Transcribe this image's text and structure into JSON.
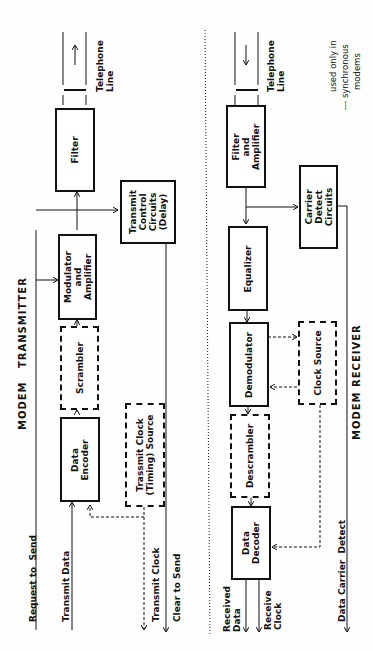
{
  "transmitter": {
    "title": "MODEM   TRANSMITTER",
    "blocks": {
      "data_encoder": "Data\nEncoder",
      "scrambler": "Scrambler",
      "modulator": "Modulator\nand\nAmplifier",
      "filter": "Filter",
      "transmit_control": "Transmit\nControl\nCircuits\n(Delay)",
      "transmit_clock_source": "Trassmit Clock\n(Timing) Source"
    },
    "signals": {
      "request_to_send": "Request to  Send",
      "transmit_data": "Transmit Data",
      "transmit_clock": "Transmit Clock",
      "clear_to_send": "Clear to Send"
    },
    "line_label": "Telephone\nLine"
  },
  "receiver": {
    "title": "MODEM RECEIVER",
    "blocks": {
      "filter_amplifier": "Filter\nand\nAmplifier",
      "equalizer": "Equalizer",
      "demodulator": "Demodulator",
      "descrambler": "Descrambler",
      "data_decoder": "Data\nDecoder",
      "carrier_detect": "Carrier\nDetect\nCircuits",
      "clock_source": "Clock Source"
    },
    "signals": {
      "received_data": "Received\nData",
      "receive_clock": "Receive\nClock",
      "data_carrier_detect": "Data Carrier  Detect"
    },
    "line_label": "Telephone\nLine"
  },
  "legend": {
    "line1": "used only in",
    "line2": "--- synchronous",
    "line3": "modems"
  }
}
